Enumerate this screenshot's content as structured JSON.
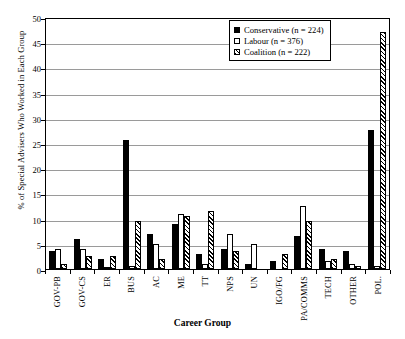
{
  "chart_data": {
    "type": "bar",
    "title": "",
    "xlabel": "Career Group",
    "ylabel": "% of Special Advisers Who Worked in Each Group",
    "ylim": [
      0,
      50
    ],
    "ytick_step": 5,
    "yticks": [
      "50",
      "45",
      "40",
      "35",
      "30",
      "25",
      "20",
      "15",
      "10",
      "5",
      "0"
    ],
    "grid": true,
    "legend_position": "top-right",
    "categories": [
      "GOV-PB",
      "GOV-CS",
      "ER",
      "BUS",
      "AC",
      "ME",
      "TT",
      "NPS",
      "UN",
      "IGO/FG",
      "PA/COMMS",
      "TECH",
      "OTHER",
      "POL."
    ],
    "series": [
      {
        "name": "Conservative (n = 224)",
        "fill": "solid-black",
        "color": "#000000",
        "values": [
          3.5,
          6.0,
          2.0,
          25.5,
          7.0,
          9.0,
          3.0,
          4.0,
          1.0,
          1.5,
          6.5,
          4.0,
          3.5,
          27.5
        ]
      },
      {
        "name": "Labour (n = 376)",
        "fill": "white-outline",
        "color": "#ffffff",
        "values": [
          4.0,
          4.0,
          0.4,
          0.5,
          5.0,
          11.0,
          1.0,
          7.0,
          5.0,
          0.0,
          12.5,
          1.5,
          1.0,
          0.5
        ]
      },
      {
        "name": "Coalition (n = 222)",
        "fill": "hatched",
        "color": "#ffffff",
        "values": [
          1.0,
          2.5,
          2.5,
          9.5,
          2.0,
          10.5,
          11.5,
          3.5,
          0.0,
          3.0,
          9.5,
          2.0,
          0.5,
          47.0
        ]
      }
    ]
  },
  "legend": {
    "items": [
      {
        "label": "Conservative (n = 224)",
        "swatch": "solid-black-swatch"
      },
      {
        "label": "Labour (n = 376)",
        "swatch": "white-outline-swatch"
      },
      {
        "label": "Coalition (n = 222)",
        "swatch": "hatched-swatch"
      }
    ]
  }
}
